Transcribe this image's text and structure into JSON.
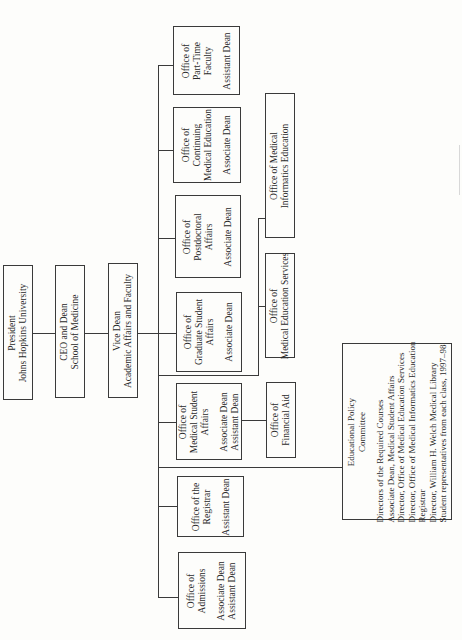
{
  "chart": {
    "top_chain": {
      "president": [
        "President",
        "Johns Hopkins University"
      ],
      "ceo": [
        "CEO and Dean",
        "School of Medicine"
      ],
      "vice_dean": [
        "Vice Dean",
        "Academic Affairs and Faculty"
      ]
    },
    "offices": [
      {
        "name": [
          "Office of",
          "Part-Time",
          "Faculty"
        ],
        "head": [
          "Assistant Dean"
        ]
      },
      {
        "name": [
          "Office of",
          "Continuing",
          "Medical Education"
        ],
        "head": [
          "Associate Dean"
        ]
      },
      {
        "name": [
          "Office of",
          "Postdoctoral",
          "Affairs"
        ],
        "head": [
          "Associate Dean"
        ]
      },
      {
        "name": [
          "Office of",
          "Graduate Student",
          "Affairs"
        ],
        "head": [
          "Associate Dean"
        ]
      },
      {
        "name": [
          "Office of",
          "Medical Student",
          "Affairs"
        ],
        "head": [
          "Associate Dean",
          "Assistant Dean"
        ]
      },
      {
        "name": [
          "Office of the",
          "Registrar"
        ],
        "head": [
          "Assistant Dean"
        ]
      },
      {
        "name": [
          "Office of",
          "Admissions"
        ],
        "head": [
          "Associate Dean",
          "Assistant Dean"
        ]
      }
    ],
    "sub_offices": {
      "informatics": [
        "Office of Medical",
        "Informatics Education"
      ],
      "med_ed_services": [
        "Office of",
        "Medical Education Services"
      ],
      "financial_aid": [
        "Office of",
        "Financial Aid"
      ]
    },
    "committee": {
      "title": [
        "Educational Policy",
        "Committee"
      ],
      "members": [
        "Directors of the Required Courses",
        "Associate Dean, Medical Student Affairs",
        "Director, Office of Medical Education Services",
        "Director, Office of Medical Informatics Education",
        "Registrar",
        "Director, William H. Welch Medical Library",
        "Student representatives from each class, 1997–98"
      ]
    }
  }
}
